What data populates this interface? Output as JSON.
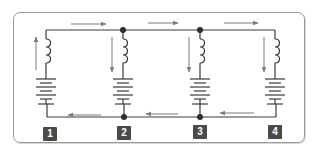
{
  "diagram": {
    "type": "parallel circuit",
    "colors": {
      "wire": "#3a3a3a",
      "arrow": "#7a7a7a",
      "junction": "#2e2e2e",
      "label_bg": "#4a4a4a",
      "label_text": "#ffffff",
      "border": "#9a9a9a"
    },
    "branches": [
      {
        "label": "1",
        "components": [
          "coil",
          "battery"
        ],
        "current_arrow": "up"
      },
      {
        "label": "2",
        "components": [
          "coil",
          "battery"
        ],
        "current_arrow": "down"
      },
      {
        "label": "3",
        "components": [
          "coil",
          "battery"
        ],
        "current_arrow": "down"
      },
      {
        "label": "4",
        "components": [
          "coil",
          "battery"
        ],
        "current_arrow": "down"
      }
    ],
    "top_wire_arrows": [
      "right",
      "right",
      "right"
    ],
    "bottom_wire_arrows": [
      "left",
      "left",
      "left"
    ],
    "junctions": 4
  }
}
